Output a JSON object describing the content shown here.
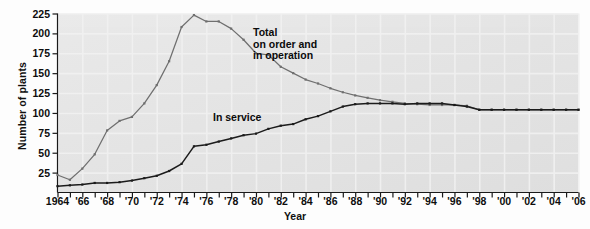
{
  "chart_data": {
    "type": "line",
    "title": "",
    "xlabel": "Year",
    "ylabel": "Number of plants",
    "xlim": [
      1964,
      2006
    ],
    "ylim": [
      0,
      225
    ],
    "yticks": [
      25,
      50,
      75,
      100,
      125,
      150,
      175,
      200,
      225
    ],
    "ytick_labels": [
      "25",
      "50",
      "75",
      "100",
      "125",
      "150",
      "175",
      "200",
      "225"
    ],
    "xticks": [
      1964,
      1965,
      1966,
      1967,
      1968,
      1969,
      1970,
      1971,
      1972,
      1973,
      1974,
      1975,
      1976,
      1977,
      1978,
      1979,
      1980,
      1981,
      1982,
      1983,
      1984,
      1985,
      1986,
      1987,
      1988,
      1989,
      1990,
      1991,
      1992,
      1993,
      1994,
      1995,
      1996,
      1997,
      1998,
      1999,
      2000,
      2001,
      2002,
      2003,
      2004,
      2005,
      2006
    ],
    "xtick_labels": [
      {
        "year": 1964,
        "label": "1964"
      },
      {
        "year": 1966,
        "label": "'66"
      },
      {
        "year": 1968,
        "label": "'68"
      },
      {
        "year": 1970,
        "label": "'70"
      },
      {
        "year": 1972,
        "label": "'72"
      },
      {
        "year": 1974,
        "label": "'74"
      },
      {
        "year": 1976,
        "label": "'76"
      },
      {
        "year": 1978,
        "label": "'78"
      },
      {
        "year": 1980,
        "label": "'80"
      },
      {
        "year": 1982,
        "label": "'82"
      },
      {
        "year": 1984,
        "label": "'84"
      },
      {
        "year": 1986,
        "label": "'86"
      },
      {
        "year": 1988,
        "label": "'88"
      },
      {
        "year": 1990,
        "label": "'90"
      },
      {
        "year": 1992,
        "label": "'92"
      },
      {
        "year": 1994,
        "label": "'94"
      },
      {
        "year": 1996,
        "label": "'96"
      },
      {
        "year": 1998,
        "label": "'98"
      },
      {
        "year": 2000,
        "label": "'00"
      },
      {
        "year": 2002,
        "label": "'02"
      },
      {
        "year": 2004,
        "label": "'04"
      },
      {
        "year": 2006,
        "label": "'06"
      }
    ],
    "grid": true,
    "legend_position": "inline-annotations",
    "annotations": [
      {
        "name": "total-label",
        "text": "Total\non order and\nin operation",
        "x": 1982,
        "y": 207
      },
      {
        "name": "in-service-label",
        "text": "In service",
        "x": 1978.8,
        "y": 111
      }
    ],
    "series": [
      {
        "name": "Total on order and in operation",
        "color": "#6f6f6f",
        "x": [
          1964,
          1965,
          1966,
          1967,
          1968,
          1969,
          1970,
          1971,
          1972,
          1973,
          1974,
          1975,
          1976,
          1977,
          1978,
          1979,
          1980,
          1981,
          1982,
          1983,
          1984,
          1985,
          1986,
          1987,
          1988,
          1989,
          1990,
          1991,
          1992,
          1993,
          1994,
          1995,
          1996,
          1997,
          1998,
          1999,
          2000,
          2001,
          2002,
          2003,
          2004,
          2005,
          2006
        ],
        "values": [
          22,
          16,
          30,
          48,
          78,
          90,
          95,
          112,
          135,
          165,
          208,
          223,
          215,
          215,
          206,
          192,
          175,
          173,
          158,
          150,
          142,
          137,
          131,
          126,
          122,
          119,
          116,
          114,
          112,
          111,
          110,
          110,
          110,
          109,
          104,
          104,
          104,
          104,
          104,
          104,
          104,
          104,
          104
        ]
      },
      {
        "name": "In service",
        "color": "#1b1b1b",
        "x": [
          1964,
          1965,
          1966,
          1967,
          1968,
          1969,
          1970,
          1971,
          1972,
          1973,
          1974,
          1975,
          1976,
          1977,
          1978,
          1979,
          1980,
          1981,
          1982,
          1983,
          1984,
          1985,
          1986,
          1987,
          1988,
          1989,
          1990,
          1991,
          1992,
          1993,
          1994,
          1995,
          1996,
          1997,
          1998,
          1999,
          2000,
          2001,
          2002,
          2003,
          2004,
          2005,
          2006
        ],
        "values": [
          8,
          9,
          10,
          12,
          12,
          13,
          15,
          18,
          21,
          27,
          36,
          58,
          60,
          64,
          68,
          72,
          74,
          80,
          84,
          86,
          92,
          96,
          102,
          108,
          111,
          112,
          112,
          112,
          111,
          112,
          112,
          112,
          110,
          108,
          104,
          104,
          104,
          104,
          104,
          104,
          104,
          104,
          104
        ]
      }
    ]
  }
}
